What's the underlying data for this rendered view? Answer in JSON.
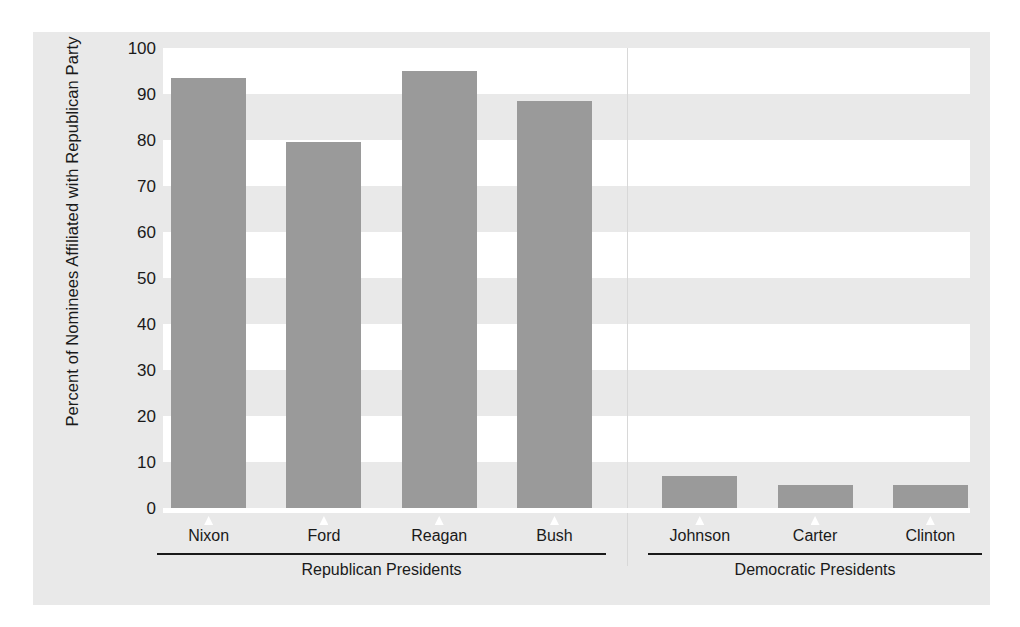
{
  "chart_data": {
    "type": "bar",
    "title": "",
    "xlabel": "",
    "ylabel": "Percent of Nominees Affiliated with Republican Party",
    "categories": [
      "Nixon",
      "Ford",
      "Reagan",
      "Bush",
      "Johnson",
      "Carter",
      "Clinton"
    ],
    "values": [
      93.5,
      79.5,
      95,
      88.5,
      7,
      5,
      5
    ],
    "ylim": [
      0,
      100
    ],
    "ytick_labels": [
      "100",
      "90",
      "80",
      "70",
      "60",
      "50",
      "40",
      "30",
      "20",
      "10",
      "0"
    ],
    "ytick_values": [
      100,
      90,
      80,
      70,
      60,
      50,
      40,
      30,
      20,
      10,
      0
    ],
    "grid": "alternating-horizontal-bands",
    "legend": "none",
    "groups": [
      {
        "label": "Republican Presidents",
        "categories": [
          "Nixon",
          "Ford",
          "Reagan",
          "Bush"
        ]
      },
      {
        "label": "Democratic Presidents",
        "categories": [
          "Johnson",
          "Carter",
          "Clinton"
        ]
      }
    ],
    "colors": {
      "bar": "#9a9a9a",
      "panel": "#e9e9e9",
      "plot": "#ffffff",
      "band": "#e9e9e9",
      "text": "#1a1a1a",
      "rule": "#1a1a1a"
    }
  }
}
